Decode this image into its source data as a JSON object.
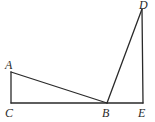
{
  "diagram": {
    "type": "geometry",
    "points": {
      "A": {
        "label": "A",
        "x": 11,
        "y": 72
      },
      "B": {
        "label": "B",
        "x": 107,
        "y": 103
      },
      "C": {
        "label": "C",
        "x": 11,
        "y": 103
      },
      "D": {
        "label": "D",
        "x": 142,
        "y": 9
      },
      "E": {
        "label": "E",
        "x": 143,
        "y": 103
      }
    },
    "segments": [
      "AC",
      "AB",
      "CE",
      "BD",
      "DE"
    ],
    "labels": {
      "A": "A",
      "B": "B",
      "C": "C",
      "D": "D",
      "E": "E"
    }
  }
}
